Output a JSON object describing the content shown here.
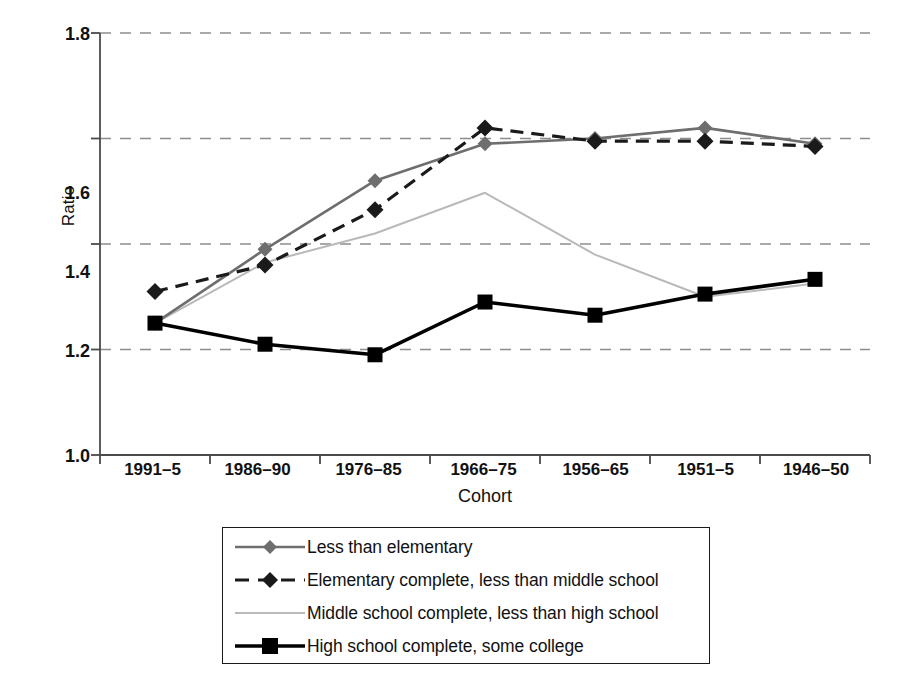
{
  "chart_data": {
    "type": "line",
    "title": "",
    "xlabel": "Cohort",
    "ylabel": "Ratio",
    "categories": [
      "1991–5",
      "1986–90",
      "1976–85",
      "1966–75",
      "1956–65",
      "1951–5",
      "1946–50"
    ],
    "ylim": [
      1.0,
      1.8
    ],
    "yticks": [
      "1.0",
      "1.2",
      "1.4",
      "1.6",
      "1.8"
    ],
    "ytick_values": [
      1.0,
      1.2,
      1.4,
      1.6,
      1.8
    ],
    "grid": "horizontal-dashed",
    "legend_position": "below-center",
    "series": [
      {
        "name": "Less than elementary",
        "color": "#6e6e6e",
        "marker": "diamond",
        "dash": "solid",
        "values": [
          1.25,
          1.39,
          1.52,
          1.59,
          1.6,
          1.62,
          1.59
        ]
      },
      {
        "name": "Elementary complete, less than middle school",
        "color": "#1a1a1a",
        "marker": "diamond",
        "dash": "dashed",
        "values": [
          1.31,
          1.36,
          1.465,
          1.62,
          1.595,
          1.595,
          1.585
        ]
      },
      {
        "name": "Middle school complete, less than high school",
        "color": "#b9b9b9",
        "marker": "none",
        "dash": "solid",
        "values": [
          1.25,
          1.365,
          1.42,
          1.497,
          1.38,
          1.3,
          1.325
        ]
      },
      {
        "name": "High school complete, some college",
        "color": "#000000",
        "marker": "square",
        "dash": "solid",
        "values": [
          1.25,
          1.21,
          1.19,
          1.29,
          1.265,
          1.305,
          1.333
        ]
      }
    ]
  },
  "axes": {
    "y_title": "Ratio",
    "x_title": "Cohort"
  },
  "legend": {
    "items": [
      {
        "label": "Less than elementary"
      },
      {
        "label": "Elementary complete, less than middle school"
      },
      {
        "label": "Middle school complete, less than high school"
      },
      {
        "label": "High school complete, some college"
      }
    ]
  },
  "colors": {
    "series1": "#6e6e6e",
    "series2": "#1a1a1a",
    "series3": "#b9b9b9",
    "series4": "#000000",
    "grid": "#8d8d8d",
    "axis": "#4a4a4a"
  }
}
